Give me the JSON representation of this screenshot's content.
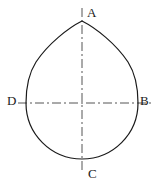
{
  "figure": {
    "kind": "technical-line-drawing",
    "width": 158,
    "height": 186,
    "background_color": "#ffffff",
    "outline_color": "#1a1a1a",
    "centerline_color": "#555555",
    "outline_width": 1.2,
    "centerline_width": 1.0
  },
  "labels": {
    "apex_top": "A",
    "right": "B",
    "bottom": "C",
    "left": "D"
  },
  "geometry": {
    "center": {
      "x": 82,
      "y": 103
    },
    "radius": 55,
    "apex": {
      "x": 82,
      "y": 21
    },
    "right_point": {
      "x": 136,
      "y": 103
    },
    "bottom_point": {
      "x": 82,
      "y": 158
    },
    "left_point": {
      "x": 26,
      "y": 103
    },
    "horizontal_centerline": {
      "x1": 18,
      "y1": 103,
      "x2": 152,
      "y2": 103
    },
    "vertical_centerline": {
      "x1": 82,
      "y1": 8,
      "x2": 82,
      "y2": 172
    },
    "dash_pattern": "9 3 2 3"
  }
}
